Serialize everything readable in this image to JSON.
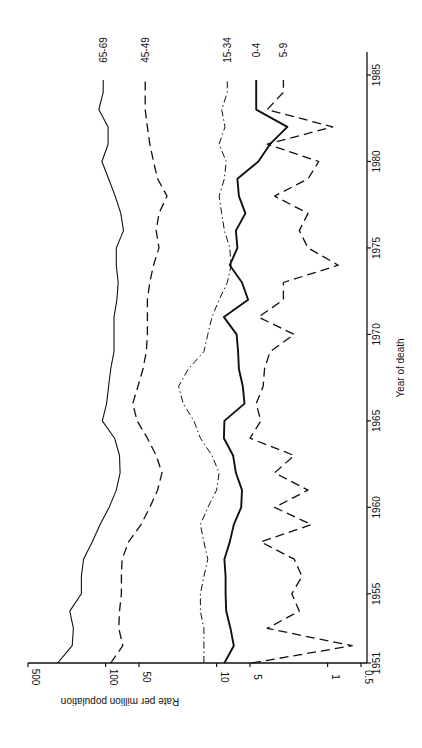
{
  "chart_data": {
    "type": "line",
    "orientation": "rotated-90-ccw",
    "title": "",
    "xlabel": "Year of death",
    "ylabel": "Rate per million population",
    "yscale": "log",
    "ylim": [
      0.5,
      500
    ],
    "xlim": [
      1951,
      1985
    ],
    "x_ticks": [
      "1951",
      "1955",
      "1960",
      "1965",
      "1970",
      "1975",
      "1980",
      "1985"
    ],
    "y_ticks": [
      "0.5",
      "1",
      "5",
      "10",
      "50",
      "100",
      "500"
    ],
    "grid": false,
    "legend_position": "end-of-line labels",
    "x": [
      1951,
      1952,
      1953,
      1954,
      1955,
      1956,
      1957,
      1958,
      1959,
      1960,
      1961,
      1962,
      1963,
      1964,
      1965,
      1966,
      1967,
      1968,
      1969,
      1970,
      1971,
      1972,
      1973,
      1974,
      1975,
      1976,
      1977,
      1978,
      1979,
      1980,
      1981,
      1982,
      1983,
      1984
    ],
    "series": [
      {
        "name": "65-69",
        "style": "solid-thin",
        "values": [
          270,
          200,
          195,
          210,
          165,
          165,
          158,
          132,
          112,
          93,
          80,
          74,
          75,
          83,
          107,
          98,
          94,
          90,
          84,
          84,
          84,
          79,
          77,
          80,
          80,
          69,
          73,
          82,
          94,
          108,
          95,
          95,
          115,
          105
        ]
      },
      {
        "name": "45-49",
        "style": "dashed",
        "values": [
          90,
          70,
          76,
          75,
          72,
          72,
          71,
          62,
          48,
          40,
          34,
          31,
          35,
          42,
          52,
          57,
          51,
          46,
          43,
          42,
          42,
          42,
          40,
          37,
          33,
          35,
          33,
          28,
          34,
          37,
          40,
          42,
          44,
          44
        ]
      },
      {
        "name": "15-34",
        "style": "dash-dot",
        "values": [
          13,
          13,
          13,
          14,
          14,
          13,
          12,
          13,
          14,
          12,
          10,
          9.5,
          11,
          14,
          16,
          20,
          22,
          18,
          13,
          12,
          11,
          9.5,
          8,
          7.4,
          7.6,
          8.5,
          9,
          9.5,
          8.5,
          8.2,
          9.5,
          8.4,
          9,
          8
        ]
      },
      {
        "name": "0-4",
        "style": "solid-thick",
        "values": [
          8.5,
          7,
          7.5,
          8.2,
          8.3,
          8.3,
          8.5,
          7.6,
          7,
          6,
          5.9,
          6.7,
          7.1,
          8.6,
          8.5,
          5.6,
          5.8,
          6.3,
          6.4,
          6.6,
          8.6,
          5.2,
          5.9,
          7.6,
          6.5,
          6.7,
          5.5,
          6.3,
          6.5,
          4.2,
          3.3,
          2.3,
          4.4,
          4.4
        ]
      },
      {
        "name": "5-9",
        "style": "dashed",
        "values": [
          4.8,
          0.6,
          3.5,
          1.8,
          2.1,
          1.7,
          2,
          4,
          1.4,
          3,
          1.5,
          3,
          2,
          5,
          4,
          4.4,
          3.8,
          3.7,
          3.3,
          2,
          4.2,
          2.5,
          2.5,
          0.8,
          1.5,
          1.8,
          1.5,
          3,
          1.5,
          1.2,
          3.5,
          0.9,
          3.5,
          2.5
        ]
      }
    ]
  },
  "labels": {
    "series_65_69": "65-69",
    "series_45_49": "45-49",
    "series_15_34": "15-34",
    "series_0_4": "0-4",
    "series_5_9": "5-9",
    "xlabel": "Year of death",
    "ylabel": "Rate per million population"
  }
}
